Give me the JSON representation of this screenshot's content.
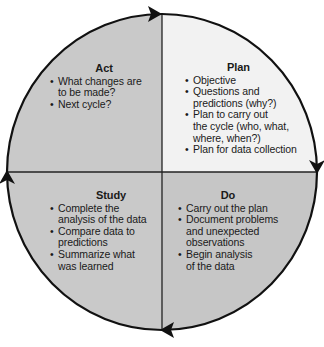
{
  "diagram": {
    "type": "PDSA cycle",
    "colors": {
      "act_fill": "#c9c9c9",
      "plan_fill": "#f2f2f2",
      "study_fill": "#c9c9c9",
      "do_fill": "#c6c6c6",
      "outline": "#111111",
      "divider": "#222222",
      "background": "#ffffff"
    },
    "quadrants": {
      "act": {
        "title": "Act",
        "items": [
          "What changes are\nto be made?",
          "Next cycle?"
        ]
      },
      "plan": {
        "title": "Plan",
        "items": [
          "Objective",
          "Questions and\npredictions (why?)",
          "Plan to carry out\nthe cycle (who, what,\nwhere, when?)",
          "Plan for data collection"
        ]
      },
      "study": {
        "title": "Study",
        "items": [
          "Complete the\nanalysis of the data",
          "Compare data to\npredictions",
          "Summarize what\nwas learned"
        ]
      },
      "do": {
        "title": "Do",
        "items": [
          "Carry out the plan",
          "Document problems\nand unexpected\nobservations",
          "Begin analysis\nof the data"
        ]
      }
    },
    "bullet_glyph": "•",
    "arrows": [
      {
        "position": "top",
        "direction": "clockwise-right",
        "icon": "arrowhead-icon"
      },
      {
        "position": "right",
        "direction": "clockwise-down",
        "icon": "arrowhead-icon"
      },
      {
        "position": "bottom",
        "direction": "clockwise-left",
        "icon": "arrowhead-icon"
      },
      {
        "position": "left",
        "direction": "clockwise-up",
        "icon": "arrowhead-icon"
      }
    ]
  }
}
